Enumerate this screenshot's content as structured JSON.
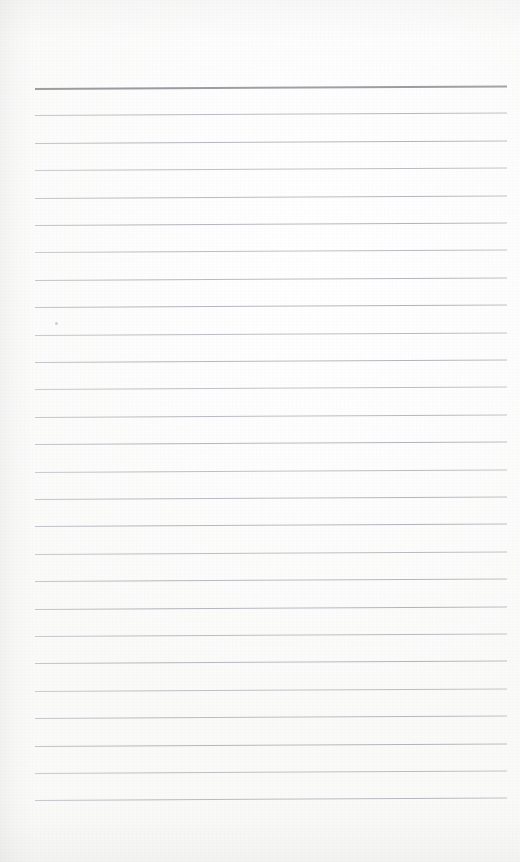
{
  "document": {
    "kind": "scanned-lined-notepad-page",
    "title": "Blank ruled notebook page",
    "width": 520,
    "height": 862,
    "background_color": "#fcfcfb",
    "text_content": "",
    "has_handwriting": false
  },
  "ruling": {
    "line_count": 27,
    "first_line_y": 88,
    "line_spacing": 27.4,
    "left_x": 35,
    "right_x": 507,
    "tilt_px": -2.5,
    "body_line_color": "#b6b9bd",
    "header_line_color": "#8d9094",
    "header_line_index": 0,
    "header_line_thickness": 2,
    "body_line_thickness": 1
  },
  "artifacts": {
    "speck": {
      "x": 55,
      "y": 322,
      "color": "#96989c"
    }
  }
}
